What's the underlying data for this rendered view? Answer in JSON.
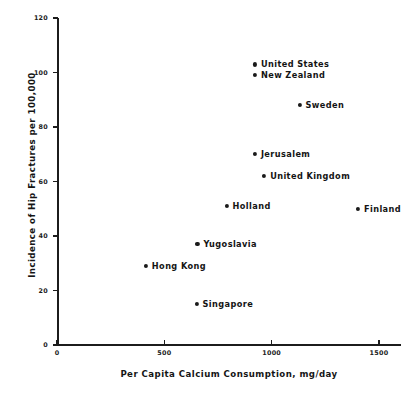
{
  "chart_data": {
    "type": "scatter",
    "title": "",
    "xlabel": "Per Capita Calcium Consumption, mg/day",
    "ylabel": "Incidence of Hip Fractures per 100,000",
    "xlim": [
      0,
      1600
    ],
    "ylim": [
      0,
      120
    ],
    "xticks": [
      0,
      500,
      1000,
      1500
    ],
    "xtick_labels": [
      "0",
      "500",
      "1000",
      "1500"
    ],
    "yticks": [
      0,
      20,
      40,
      60,
      80,
      100,
      120
    ],
    "ytick_labels": [
      "0",
      "20",
      "40",
      "60",
      "80",
      "100",
      "120"
    ],
    "grid": false,
    "legend": "none",
    "marker": "filled-circle",
    "marker_color": "#1a1a1a",
    "label_position": "right-of-marker",
    "points": [
      {
        "label": "United States",
        "x": 922,
        "y": 103
      },
      {
        "label": "New Zealand",
        "x": 922,
        "y": 99
      },
      {
        "label": "Sweden",
        "x": 1130,
        "y": 88
      },
      {
        "label": "Jerusalem",
        "x": 922,
        "y": 70
      },
      {
        "label": "United Kingdom",
        "x": 965,
        "y": 62
      },
      {
        "label": "Holland",
        "x": 790,
        "y": 51
      },
      {
        "label": "Finland",
        "x": 1402,
        "y": 50
      },
      {
        "label": "Yugoslavia",
        "x": 654,
        "y": 37
      },
      {
        "label": "Hong Kong",
        "x": 414,
        "y": 29
      },
      {
        "label": "Singapore",
        "x": 650,
        "y": 15
      }
    ]
  },
  "colors": {
    "ink": "#1a1a1a",
    "background": "#ffffff"
  }
}
